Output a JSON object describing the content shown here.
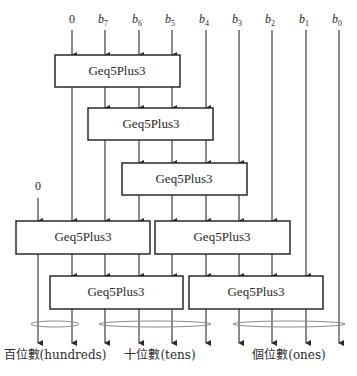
{
  "diagram": {
    "title": "",
    "inputs": [
      {
        "id": "c0",
        "label": "0",
        "sub": ""
      },
      {
        "id": "b7",
        "label": "b",
        "sub": "7"
      },
      {
        "id": "b6",
        "label": "b",
        "sub": "6"
      },
      {
        "id": "b5",
        "label": "b",
        "sub": "5"
      },
      {
        "id": "b4",
        "label": "b",
        "sub": "4"
      },
      {
        "id": "b3",
        "label": "b",
        "sub": "3"
      },
      {
        "id": "b2",
        "label": "b",
        "sub": "2"
      },
      {
        "id": "b1",
        "label": "b",
        "sub": "1"
      },
      {
        "id": "b0",
        "label": "b",
        "sub": "0"
      }
    ],
    "extra_input": {
      "label": "0"
    },
    "module_label": "Geq5Plus3",
    "modules": [
      {
        "id": "m1",
        "label": "Geq5Plus3"
      },
      {
        "id": "m2",
        "label": "Geq5Plus3"
      },
      {
        "id": "m3",
        "label": "Geq5Plus3"
      },
      {
        "id": "m4",
        "label": "Geq5Plus3"
      },
      {
        "id": "m5",
        "label": "Geq5Plus3"
      },
      {
        "id": "m6",
        "label": "Geq5Plus3"
      },
      {
        "id": "m7",
        "label": "Geq5Plus3"
      }
    ],
    "outputs": [
      {
        "id": "hundreds",
        "label": "百位數(hundreds)"
      },
      {
        "id": "tens",
        "label": "十位數(tens)"
      },
      {
        "id": "ones",
        "label": "個位數(ones)"
      }
    ]
  }
}
